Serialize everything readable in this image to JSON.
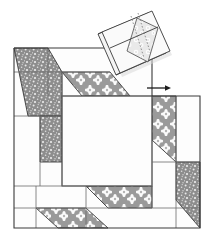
{
  "diagram": {
    "canvas": {
      "width": 208,
      "height": 242,
      "background": "#ffffff"
    },
    "colors": {
      "outline": "#3a3a3a",
      "seam_line": "#6b6b6b",
      "fabric_plain": "#fdfdfd",
      "fabric_speckled_base": "#8d8d8d",
      "fabric_speckled_dot": "#e8e8e8",
      "fabric_floral_base": "#9a9a9a",
      "fabric_floral_flower": "#fbfbfb",
      "fabric_flap_light": "#f2f2f2",
      "fabric_flap_floral_base": "#e4e4e4",
      "stitch_dash": "#7a7a7a",
      "arrow": "#1d1d1d",
      "shadow": "#c9c9c9"
    },
    "block": {
      "label": "main-quilt-block",
      "left": 14,
      "top": 48,
      "right": 200,
      "bottom": 228
    },
    "center_square": {
      "label": "center-square",
      "fabric": "plain",
      "left": 62,
      "top": 96,
      "right": 152,
      "bottom": 186
    },
    "patches": [
      {
        "name": "patch-top-left-speckled",
        "fabric": "speckled",
        "points": "14,48 48,48 62,72 62,116 28,116"
      },
      {
        "name": "patch-top-strip-floral",
        "fabric": "floral",
        "points": "62,72 110,72 130,96 82,96"
      },
      {
        "name": "patch-left-mid-speckled",
        "fabric": "speckled",
        "points": "40,116 62,116 62,162 40,162"
      },
      {
        "name": "patch-right-upper-floral",
        "fabric": "floral",
        "points": "152,96 176,96 176,162 152,140"
      },
      {
        "name": "patch-right-lower-speckled",
        "fabric": "speckled",
        "points": "176,162 200,162 200,228 176,200"
      },
      {
        "name": "patch-bottom-strip-floral",
        "fabric": "floral",
        "points": "86,186 152,186 152,208 108,208"
      },
      {
        "name": "patch-bottom-left-floral",
        "fabric": "floral",
        "points": "36,208 86,208 108,228 58,228"
      }
    ],
    "seams": [
      {
        "name": "seam-top-horizontal",
        "x1": 14,
        "y1": 72,
        "x2": 110,
        "y2": 72
      },
      {
        "name": "seam-top-inner",
        "x1": 62,
        "y1": 96,
        "x2": 152,
        "y2": 96
      },
      {
        "name": "seam-left-vertical-a",
        "x1": 48,
        "y1": 48,
        "x2": 48,
        "y2": 96
      },
      {
        "name": "seam-left-vertical-b",
        "x1": 62,
        "y1": 72,
        "x2": 62,
        "y2": 186
      },
      {
        "name": "seam-left-horizontal",
        "x1": 14,
        "y1": 116,
        "x2": 62,
        "y2": 116
      },
      {
        "name": "seam-left-lower",
        "x1": 14,
        "y1": 186,
        "x2": 152,
        "y2": 186
      },
      {
        "name": "seam-bottom-horizontal",
        "x1": 14,
        "y1": 208,
        "x2": 200,
        "y2": 208
      },
      {
        "name": "seam-right-vertical-a",
        "x1": 152,
        "y1": 96,
        "x2": 152,
        "y2": 208
      },
      {
        "name": "seam-right-vertical-b",
        "x1": 176,
        "y1": 96,
        "x2": 176,
        "y2": 228
      },
      {
        "name": "seam-right-horizontal",
        "x1": 152,
        "y1": 162,
        "x2": 200,
        "y2": 162
      },
      {
        "name": "seam-bottom-vertical",
        "x1": 86,
        "y1": 186,
        "x2": 86,
        "y2": 228
      },
      {
        "name": "seam-bottom-vertical-b",
        "x1": 36,
        "y1": 186,
        "x2": 36,
        "y2": 228
      }
    ],
    "flap": {
      "name": "folded-flap",
      "rotation_deg": -38,
      "outer": "100,33 150,12 168,52 118,74",
      "fold_edge": "107,50 156,28",
      "thickness_edges": [
        {
          "x1": 100,
          "y1": 33,
          "x2": 104,
          "y2": 36
        },
        {
          "x1": 118,
          "y1": 74,
          "x2": 122,
          "y2": 77
        }
      ],
      "floral_patch": "138,18 160,30 150,62 128,50",
      "stitch_lines": [
        {
          "x1": 133,
          "y1": 16,
          "x2": 146,
          "y2": 58
        },
        {
          "x1": 140,
          "y1": 14,
          "x2": 153,
          "y2": 55
        }
      ]
    },
    "arrow": {
      "name": "direction-arrow",
      "x1": 147,
      "y1": 88,
      "x2": 168,
      "y2": 88,
      "direction": "right"
    }
  }
}
